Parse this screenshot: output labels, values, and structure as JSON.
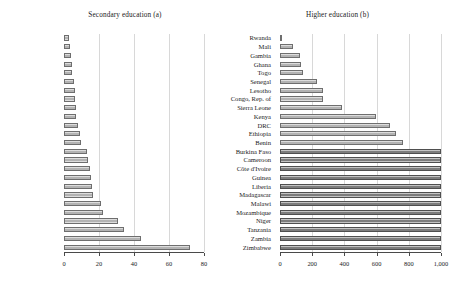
{
  "figure": {
    "panels": [
      "a",
      "b"
    ]
  },
  "chart_data": [
    {
      "type": "bar",
      "orientation": "horizontal",
      "title": "Secondary education (a)",
      "xlabel": "",
      "ylabel": "",
      "xlim": [
        0,
        80
      ],
      "ticks": [
        0,
        20,
        40,
        60,
        80
      ],
      "tick_labels": [
        "0",
        "20",
        "40",
        "60",
        "80"
      ],
      "grid": true,
      "legend": "none",
      "categories": [
        "Gambia",
        "Togo",
        "Zimbabwe",
        "Ghana",
        "DRC",
        "Rwanda",
        "Kenya",
        "Sierra Leone",
        "Mali",
        "Benin",
        "Senegal",
        "Cameroon",
        "Zambia",
        "Lesotho",
        "Tanzania",
        "Mozambique",
        "Madagascar",
        "Niger",
        "Malawi",
        "Guinea",
        "Burkina Faso",
        "Congo, Rep. of",
        "Côte d'Ivoire",
        "Liberia",
        "Ethiopia"
      ],
      "values": [
        3,
        3.5,
        4,
        4.5,
        4.5,
        5.5,
        6,
        6.5,
        7,
        7,
        8,
        9,
        9.5,
        13,
        13.5,
        15,
        15.5,
        16,
        16.5,
        21,
        22.5,
        31,
        34,
        44,
        72
      ]
    },
    {
      "type": "bar",
      "orientation": "horizontal",
      "title": "Higher education (b)",
      "xlabel": "",
      "ylabel": "",
      "xlim": [
        0,
        1000
      ],
      "ticks": [
        0,
        200,
        400,
        600,
        800,
        1000
      ],
      "tick_labels": [
        "0",
        "200",
        "400",
        "600",
        "800",
        "1,000"
      ],
      "grid": true,
      "legend": "none",
      "categories": [
        "Rwanda",
        "Mali",
        "Gambia",
        "Ghana",
        "Togo",
        "Senegal",
        "Lesotho",
        "Congo, Rep. of",
        "Sierra Leone",
        "Kenya",
        "DRC",
        "Ethiopia",
        "Benin",
        "Burkina Faso",
        "Cameroon",
        "Côte d'Ivoire",
        "Guinea",
        "Liberia",
        "Madagascar",
        "Malawi",
        "Mozambique",
        "Niger",
        "Tanzania",
        "Zambia",
        "Zimbabwe"
      ],
      "values": [
        12,
        80,
        125,
        130,
        145,
        228,
        265,
        265,
        388,
        595,
        685,
        720,
        765,
        1000,
        1000,
        1000,
        1000,
        1000,
        1000,
        1000,
        1000,
        1000,
        1000,
        1000,
        1000
      ],
      "capped_at": 1000,
      "capped_color": "#7d7d7d",
      "bar_color": "#b3b3b3"
    }
  ],
  "colors": {
    "bar_fill": "#b3b3b3",
    "bar_edge": "#6e6e6e",
    "bar_fill_capped": "#7d7d7d",
    "bar_edge_capped": "#4f4f4f",
    "gridline": "#d8d8d8",
    "axis": "#4a4a4a",
    "text": "#1a1a1a",
    "background": "#ffffff"
  }
}
